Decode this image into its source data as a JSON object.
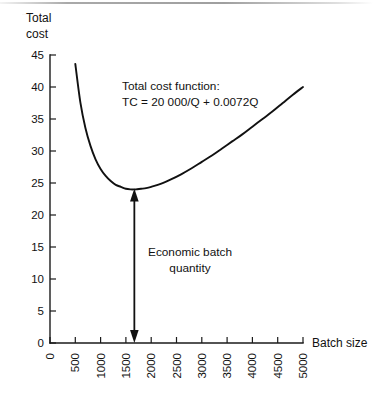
{
  "chart_data": {
    "type": "line",
    "title": "",
    "xlabel": "Batch size",
    "ylabel": "Total cost",
    "ylabel_lines": [
      "Total",
      "cost"
    ],
    "xlim": [
      0,
      5000
    ],
    "ylim": [
      0,
      45
    ],
    "xticks": [
      0,
      500,
      1000,
      1500,
      2000,
      2500,
      3000,
      3500,
      4000,
      4500,
      5000
    ],
    "xticklabels": [
      "0",
      "500",
      "1000",
      "1500",
      "2000",
      "2500",
      "3000",
      "3500",
      "4000",
      "4500",
      "5000"
    ],
    "xticklabel_rotation": -90,
    "yticks": [
      0,
      5,
      10,
      15,
      20,
      25,
      30,
      35,
      40,
      45
    ],
    "yticklabels": [
      "0",
      "5",
      "10",
      "15",
      "20",
      "25",
      "30",
      "35",
      "40",
      "45"
    ],
    "grid": false,
    "legend": "none",
    "formula": "TC = 20000/Q + 0.0072Q",
    "series": [
      {
        "name": "Total cost function",
        "x": [
          500,
          600,
          700,
          800,
          900,
          1000,
          1100,
          1200,
          1300,
          1400,
          1500,
          1600,
          1667,
          1700,
          1800,
          1900,
          2000,
          2200,
          2400,
          2600,
          2800,
          3000,
          3200,
          3400,
          3600,
          3800,
          4000,
          4200,
          4400,
          4600,
          4800,
          5000
        ],
        "y": [
          43.6,
          37.6,
          33.6,
          30.8,
          28.7,
          27.2,
          26.1,
          25.3,
          24.7,
          24.4,
          24.1,
          24.0,
          24.0,
          24.0,
          24.1,
          24.2,
          24.4,
          24.9,
          25.6,
          26.4,
          27.3,
          28.3,
          29.3,
          30.4,
          31.5,
          32.6,
          33.8,
          35.0,
          36.2,
          37.5,
          38.8,
          40.0
        ]
      }
    ],
    "annotations": [
      {
        "name": "total-cost-function-note",
        "lines": [
          "Total cost function:",
          "TC = 20 000/Q + 0.0072Q"
        ]
      },
      {
        "name": "economic-batch-quantity-note",
        "lines": [
          "Economic batch",
          "quantity"
        ],
        "marker": "double-headed-vertical-arrow",
        "at_x": 1667,
        "from_y": 0,
        "to_y": 24
      }
    ],
    "colors": {
      "curve": "#111111",
      "axis": "#1a1a1a",
      "text": "#111111",
      "background": "#ffffff"
    }
  },
  "figure": {
    "axis_title_y_line1": "Total",
    "axis_title_y_line2": "cost",
    "axis_title_x": "Batch size",
    "note1_line1": "Total cost function:",
    "note1_line2": "TC = 20 000/Q + 0.0072Q",
    "note2_line1": "Economic batch",
    "note2_line2": "quantity",
    "y_0": "0",
    "y_5": "5",
    "y_10": "10",
    "y_15": "15",
    "y_20": "20",
    "y_25": "25",
    "y_30": "30",
    "y_35": "35",
    "y_40": "40",
    "y_45": "45",
    "x_0": "0",
    "x_500": "500",
    "x_1000": "1000",
    "x_1500": "1500",
    "x_2000": "2000",
    "x_2500": "2500",
    "x_3000": "3000",
    "x_3500": "3500",
    "x_4000": "4000",
    "x_4500": "4500",
    "x_5000": "5000"
  }
}
